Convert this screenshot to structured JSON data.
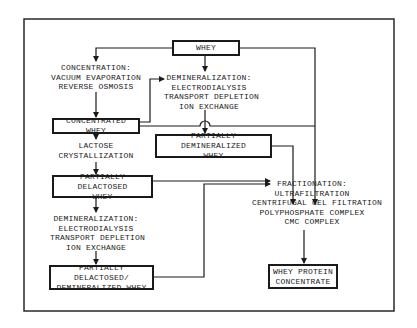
{
  "diagram": {
    "nodes": {
      "whey": {
        "label": "WHEY"
      },
      "concentrated_whey": {
        "label": "CONCENTRATED WHEY"
      },
      "partially_demineralized_whey": {
        "lines": [
          "PARTIALLY DEMINERALIZED",
          "WHEY"
        ]
      },
      "partially_delactosed_whey": {
        "lines": [
          "PARTIALLY DELACTOSED",
          "WHEY"
        ]
      },
      "partially_delactosed_demineralized_whey": {
        "lines": [
          "PARTIALLY DELACTOSED/",
          "DEMINERALIZED WHEY"
        ]
      },
      "whey_protein_concentrate": {
        "lines": [
          "WHEY PROTEIN",
          "CONCENTRATE"
        ]
      }
    },
    "processes": {
      "concentration": [
        "CONCENTRATION:",
        "VACUUM EVAPORATION",
        "REVERSE  OSMOSIS"
      ],
      "demineralization_top": [
        "DEMINERALIZATION:",
        "ELECTRODIALYSIS",
        "TRANSPORT DEPLETION",
        "ION  EXCHANGE"
      ],
      "lactose_crystallization": [
        "LACTOSE",
        "CRYSTALLIZATION"
      ],
      "demineralization_bottom": [
        "DEMINERALIZATION:",
        "ELECTRODIALYSIS",
        "TRANSPORT DEPLETION",
        "ION  EXCHANGE"
      ],
      "fractionation": [
        "FRACTIONATION:",
        "ULTRAFILTRATION",
        "CENTRIFUGAL GEL FILTRATION",
        "POLYPHOSPHATE COMPLEX",
        "CMC COMPLEX"
      ]
    },
    "edges": [
      {
        "from": "whey",
        "to": "concentration"
      },
      {
        "from": "whey",
        "to": "demineralization_top"
      },
      {
        "from": "whey",
        "to": "fractionation"
      },
      {
        "from": "concentration",
        "to": "concentrated_whey"
      },
      {
        "from": "concentrated_whey",
        "to": "demineralization_top"
      },
      {
        "from": "concentrated_whey",
        "to": "lactose_crystallization"
      },
      {
        "from": "concentrated_whey",
        "to": "fractionation"
      },
      {
        "from": "demineralization_top",
        "to": "partially_demineralized_whey"
      },
      {
        "from": "partially_demineralized_whey",
        "to": "fractionation"
      },
      {
        "from": "lactose_crystallization",
        "to": "partially_delactosed_whey"
      },
      {
        "from": "partially_delactosed_whey",
        "to": "demineralization_bottom"
      },
      {
        "from": "partially_delactosed_whey",
        "to": "fractionation"
      },
      {
        "from": "demineralization_bottom",
        "to": "partially_delactosed_demineralized_whey"
      },
      {
        "from": "partially_delactosed_demineralized_whey",
        "to": "fractionation"
      },
      {
        "from": "fractionation",
        "to": "whey_protein_concentrate"
      }
    ]
  }
}
